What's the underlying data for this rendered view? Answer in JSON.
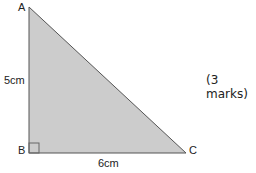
{
  "diagram": {
    "type": "right-triangle",
    "vertices": {
      "A": {
        "label": "A"
      },
      "B": {
        "label": "B",
        "right_angle": true
      },
      "C": {
        "label": "C"
      }
    },
    "sides": {
      "AB": {
        "label": "5cm"
      },
      "BC": {
        "label": "6cm"
      }
    },
    "fill_color": "#c8c8c8",
    "stroke_color": "#555555"
  },
  "marks_label": "(3 marks)"
}
